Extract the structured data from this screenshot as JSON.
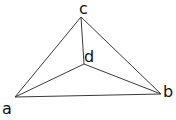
{
  "diagram": {
    "type": "graph",
    "vertices": [
      {
        "id": "a",
        "label": "a",
        "x": 15,
        "y": 97
      },
      {
        "id": "b",
        "label": "b",
        "x": 161,
        "y": 94
      },
      {
        "id": "c",
        "label": "c",
        "x": 81,
        "y": 17
      },
      {
        "id": "d",
        "label": "d",
        "x": 84,
        "y": 64
      }
    ],
    "edges": [
      {
        "from": "a",
        "to": "b"
      },
      {
        "from": "a",
        "to": "c"
      },
      {
        "from": "b",
        "to": "c"
      },
      {
        "from": "a",
        "to": "d"
      },
      {
        "from": "b",
        "to": "d"
      },
      {
        "from": "c",
        "to": "d"
      }
    ],
    "labels": {
      "a": "a",
      "b": "b",
      "c": "c",
      "d": "d"
    }
  }
}
